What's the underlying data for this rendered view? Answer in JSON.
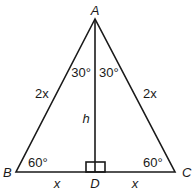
{
  "diagram": {
    "type": "isosceles-triangle-with-altitude",
    "vertices": {
      "A": {
        "label": "A",
        "x": 95,
        "y": 19
      },
      "B": {
        "label": "B",
        "x": 16,
        "y": 172
      },
      "C": {
        "label": "C",
        "x": 175,
        "y": 172
      },
      "D": {
        "label": "D",
        "x": 95,
        "y": 172
      }
    },
    "angles": {
      "BAD": "30°",
      "DAC": "30°",
      "ABD": "60°",
      "ACD": "60°",
      "ADB": "right-angle"
    },
    "sides": {
      "AB": "2x",
      "AC": "2x",
      "BD": "x",
      "DC": "x",
      "AD": "h"
    }
  },
  "labels": {
    "A": "A",
    "B": "B",
    "C": "C",
    "D": "D",
    "angle_left_top": "30°",
    "angle_right_top": "30°",
    "angle_B": "60°",
    "angle_C": "60°",
    "side_AB": "2x",
    "side_AC": "2x",
    "side_BD": "x",
    "side_DC": "x",
    "altitude": "h"
  }
}
